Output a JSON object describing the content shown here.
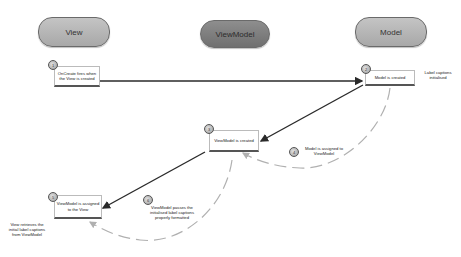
{
  "lanes": {
    "view": "View",
    "viewmodel": "ViewModel",
    "model": "Model"
  },
  "steps": [
    {
      "number": "1",
      "text": "OnCreate fires when the View is created"
    },
    {
      "number": "2",
      "text": "Model is created"
    },
    {
      "number": "3",
      "text": "ViewModel is created"
    },
    {
      "number": "4",
      "text": "Model is assigned to ViewModel"
    },
    {
      "number": "5",
      "text": "ViewModel is assigned to the View"
    },
    {
      "number": "6",
      "text": "ViewModel passes the initialised label captions properly formatted"
    }
  ],
  "notes": {
    "model_side": "Label captions initialised",
    "view_side": "View retrieves the initial label captions from ViewModel"
  },
  "colors": {
    "pill_light": "#b5b5b5",
    "pill_dark": "#7d7d7d",
    "arrow": "#2a2a2a",
    "dashed": "#b0b0b0"
  }
}
